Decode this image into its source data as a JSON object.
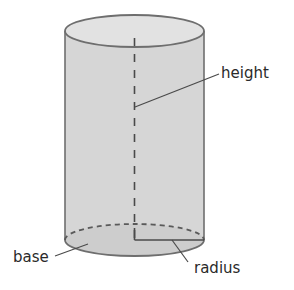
{
  "diagram": {
    "labels": {
      "height": "height",
      "base": "base",
      "radius": "radius"
    },
    "colors": {
      "fill": "#d6d6d6",
      "base_fill": "#cfcfcf",
      "stroke": "#6e6e6e",
      "dash": "#4a4a4a",
      "text": "#2a2a2a"
    }
  }
}
